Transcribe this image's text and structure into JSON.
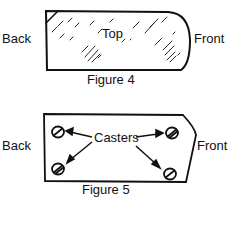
{
  "figure4": {
    "caption": "Figure 4",
    "labels": {
      "back": "Back",
      "top": "Top",
      "front": "Front"
    }
  },
  "figure5": {
    "caption": "Figure 5",
    "labels": {
      "back": "Back",
      "casters": "Casters",
      "front": "Front"
    },
    "caster_count": 4
  },
  "colors": {
    "ink": "#111111",
    "background": "#ffffff"
  }
}
